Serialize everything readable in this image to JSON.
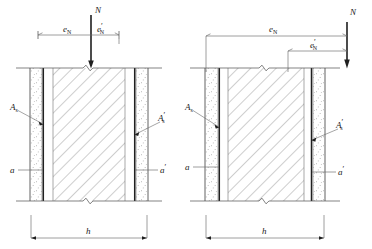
{
  "figure": {
    "panels": [
      {
        "id": "left",
        "name": "large-eccentricity-case",
        "load_label": "N",
        "eccentricity_left_label": "e",
        "eccentricity_left_sub": "N",
        "eccentricity_right_label": "e",
        "eccentricity_right_sub": "N",
        "eccentricity_right_prime": "′",
        "rebar_left_label": "A",
        "rebar_left_sub": "s",
        "rebar_right_label": "A",
        "rebar_right_sub": "s",
        "rebar_right_prime": "′",
        "cover_left_label": "a",
        "cover_right_label": "a",
        "cover_right_prime": "′",
        "width_label": "h"
      },
      {
        "id": "right",
        "name": "small-eccentricity-case",
        "load_label": "N",
        "eccentricity_left_label": "e",
        "eccentricity_left_sub": "N",
        "eccentricity_right_label": "e",
        "eccentricity_right_sub": "N",
        "eccentricity_right_prime": "′",
        "rebar_left_label": "A",
        "rebar_left_sub": "s",
        "rebar_right_label": "A",
        "rebar_right_sub": "s",
        "rebar_right_prime": "′",
        "cover_left_label": "a",
        "cover_right_label": "a",
        "cover_right_prime": "′",
        "width_label": "h"
      }
    ],
    "colors": {
      "line": "#4d4d4d",
      "heavy_line": "#1f1f1f",
      "hatch": "#5a5a5a",
      "background": "#ffffff"
    }
  }
}
